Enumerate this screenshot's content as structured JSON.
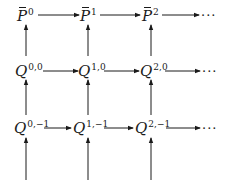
{
  "diagram": {
    "type": "commutative-grid",
    "color": "#1a1a1a",
    "rows": [
      {
        "name": "p-bar-row",
        "nodes": [
          {
            "base": "P",
            "sup": "0",
            "overbar": true
          },
          {
            "base": "P",
            "sup": "1",
            "overbar": true
          },
          {
            "base": "P",
            "sup": "2",
            "overbar": true
          }
        ],
        "continuation": "···"
      },
      {
        "name": "q-row-0",
        "nodes": [
          {
            "base": "Q",
            "sup": "0,0"
          },
          {
            "base": "Q",
            "sup": "1,0"
          },
          {
            "base": "Q",
            "sup": "2,0"
          }
        ],
        "continuation": "···"
      },
      {
        "name": "q-row-minus1",
        "nodes": [
          {
            "base": "Q",
            "sup": "0,−1"
          },
          {
            "base": "Q",
            "sup": "1,−1"
          },
          {
            "base": "Q",
            "sup": "2,−1"
          }
        ],
        "continuation": "···"
      }
    ],
    "arrows": {
      "horizontal": "left-to-right between adjacent nodes in each row, last to continuation dots",
      "vertical": "upward into each node from the row below; bottom row receives arrows from below"
    }
  }
}
